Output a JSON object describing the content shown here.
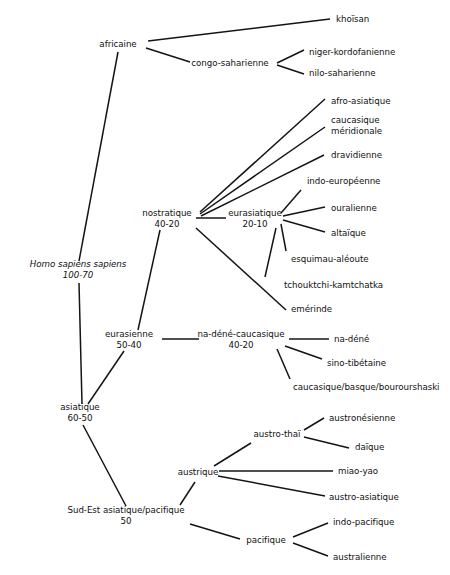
{
  "diagram": {
    "type": "phylogenetic-tree",
    "orientation": "left-to-right",
    "line_color": "#141414",
    "background_color": "#ffffff",
    "text_color": "#111111"
  },
  "nodes": [
    {
      "id": "hss",
      "name": "Homo sapiens sapiens",
      "date": "100-70",
      "italic": true,
      "x": 78,
      "y": 270,
      "align": "center"
    },
    {
      "id": "africaine",
      "name": "africaine",
      "date": "",
      "italic": false,
      "x": 118,
      "y": 44,
      "align": "center"
    },
    {
      "id": "khoisan",
      "name": "khoïsan",
      "date": "",
      "italic": false,
      "x": 336,
      "y": 19,
      "align": "left"
    },
    {
      "id": "congosah",
      "name": "congo-saharienne",
      "date": "",
      "italic": false,
      "x": 230,
      "y": 63,
      "align": "center"
    },
    {
      "id": "nigerkord",
      "name": "niger-kordofanienne",
      "date": "",
      "italic": false,
      "x": 309,
      "y": 52,
      "align": "left"
    },
    {
      "id": "nilosah",
      "name": "nilo-saharienne",
      "date": "",
      "italic": false,
      "x": 309,
      "y": 73,
      "align": "left"
    },
    {
      "id": "nostratique",
      "name": "nostratique",
      "date": "40-20",
      "italic": false,
      "x": 167,
      "y": 219,
      "align": "center"
    },
    {
      "id": "eurasiatique",
      "name": "eurasiatique",
      "date": "20-10",
      "italic": false,
      "x": 255,
      "y": 219,
      "align": "center"
    },
    {
      "id": "afroasia",
      "name": "afro-asiatique",
      "date": "",
      "italic": false,
      "x": 331,
      "y": 101,
      "align": "left"
    },
    {
      "id": "caucmer",
      "name": "caucasique\nméridionale",
      "date": "",
      "italic": false,
      "x": 331,
      "y": 126,
      "align": "left"
    },
    {
      "id": "dravidienne",
      "name": "dravidienne",
      "date": "",
      "italic": false,
      "x": 331,
      "y": 155,
      "align": "left"
    },
    {
      "id": "indoeuro",
      "name": "indo-européenne",
      "date": "",
      "italic": false,
      "x": 307,
      "y": 181,
      "align": "left"
    },
    {
      "id": "ouralienne",
      "name": "ouralienne",
      "date": "",
      "italic": false,
      "x": 331,
      "y": 208,
      "align": "left"
    },
    {
      "id": "altaique",
      "name": "altaïque",
      "date": "",
      "italic": false,
      "x": 331,
      "y": 233,
      "align": "left"
    },
    {
      "id": "esquimau",
      "name": "esquimau-aléoute",
      "date": "",
      "italic": false,
      "x": 291,
      "y": 259,
      "align": "left"
    },
    {
      "id": "tchouktchi",
      "name": "tchouktchi-kamtchatka",
      "date": "",
      "italic": false,
      "x": 284,
      "y": 285,
      "align": "left"
    },
    {
      "id": "emerinde",
      "name": "emérinde",
      "date": "",
      "italic": false,
      "x": 291,
      "y": 309,
      "align": "left"
    },
    {
      "id": "eurasienne",
      "name": "eurasienne",
      "date": "50-40",
      "italic": false,
      "x": 129,
      "y": 340,
      "align": "center"
    },
    {
      "id": "nadenecauc",
      "name": "na-déné-caucasique",
      "date": "40-20",
      "italic": false,
      "x": 241,
      "y": 340,
      "align": "center"
    },
    {
      "id": "nadene",
      "name": "na-déné",
      "date": "",
      "italic": false,
      "x": 334,
      "y": 339,
      "align": "left"
    },
    {
      "id": "sinotib",
      "name": "sino-tibétaine",
      "date": "",
      "italic": false,
      "x": 327,
      "y": 363,
      "align": "left"
    },
    {
      "id": "caucbasque",
      "name": "caucasique/basque/bourourshaski",
      "date": "",
      "italic": false,
      "x": 293,
      "y": 387,
      "align": "left"
    },
    {
      "id": "asiatique",
      "name": "asiatique",
      "date": "60-50",
      "italic": false,
      "x": 80,
      "y": 413,
      "align": "center"
    },
    {
      "id": "sudest",
      "name": "Sud-Est asiatique/pacifique",
      "date": "50",
      "italic": false,
      "x": 126,
      "y": 516,
      "align": "center"
    },
    {
      "id": "austrothai",
      "name": "austro-thaï",
      "date": "",
      "italic": false,
      "x": 277,
      "y": 434,
      "align": "center"
    },
    {
      "id": "austrique",
      "name": "austrique",
      "date": "",
      "italic": false,
      "x": 198,
      "y": 472,
      "align": "center"
    },
    {
      "id": "austronesien",
      "name": "austronésienne",
      "date": "",
      "italic": false,
      "x": 329,
      "y": 418,
      "align": "left"
    },
    {
      "id": "daique",
      "name": "daïque",
      "date": "",
      "italic": false,
      "x": 355,
      "y": 447,
      "align": "left"
    },
    {
      "id": "miaoyao",
      "name": "miao-yao",
      "date": "",
      "italic": false,
      "x": 338,
      "y": 471,
      "align": "left"
    },
    {
      "id": "austroasia",
      "name": "austro-asiatique",
      "date": "",
      "italic": false,
      "x": 329,
      "y": 497,
      "align": "left"
    },
    {
      "id": "pacifique",
      "name": "pacifique",
      "date": "",
      "italic": false,
      "x": 266,
      "y": 540,
      "align": "center"
    },
    {
      "id": "indopac",
      "name": "indo-pacifique",
      "date": "",
      "italic": false,
      "x": 333,
      "y": 522,
      "align": "left"
    },
    {
      "id": "australienne",
      "name": "australienne",
      "date": "",
      "italic": false,
      "x": 333,
      "y": 557,
      "align": "left"
    }
  ],
  "edges": [
    {
      "from": "africaine",
      "to": "khoisan",
      "x1": 148,
      "y1": 41,
      "x2": 330,
      "y2": 19
    },
    {
      "from": "africaine",
      "to": "congosah",
      "x1": 146,
      "y1": 48,
      "x2": 190,
      "y2": 62
    },
    {
      "from": "congosah",
      "to": "nigerkord",
      "x1": 277,
      "y1": 63,
      "x2": 304,
      "y2": 50
    },
    {
      "from": "congosah",
      "to": "nilosah",
      "x1": 277,
      "y1": 65,
      "x2": 304,
      "y2": 74
    },
    {
      "from": "africaine",
      "to": "hss",
      "x1": 118,
      "y1": 52,
      "x2": 79,
      "y2": 261
    },
    {
      "from": "nostratique",
      "to": "afroasia",
      "x1": 200,
      "y1": 212,
      "x2": 325,
      "y2": 99
    },
    {
      "from": "nostratique",
      "to": "caucmer",
      "x1": 200,
      "y1": 214,
      "x2": 325,
      "y2": 127
    },
    {
      "from": "nostratique",
      "to": "dravidienne",
      "x1": 201,
      "y1": 216,
      "x2": 324,
      "y2": 155
    },
    {
      "from": "eurasiatique",
      "to": "indoeuro",
      "x1": 281,
      "y1": 213,
      "x2": 301,
      "y2": 190
    },
    {
      "from": "eurasiatique",
      "to": "ouralienne",
      "x1": 283,
      "y1": 216,
      "x2": 325,
      "y2": 207
    },
    {
      "from": "eurasiatique",
      "to": "altaique",
      "x1": 283,
      "y1": 220,
      "x2": 325,
      "y2": 232
    },
    {
      "from": "eurasiatique",
      "to": "esquimau",
      "x1": 281,
      "y1": 224,
      "x2": 286,
      "y2": 251
    },
    {
      "from": "eurasiatique",
      "to": "tchouktchi",
      "x1": 276,
      "y1": 228,
      "x2": 265,
      "y2": 277
    },
    {
      "from": "nostratique",
      "to": "eurasiatique",
      "x1": 196,
      "y1": 218,
      "x2": 226,
      "y2": 218
    },
    {
      "from": "nostratique",
      "to": "emerinde",
      "x1": 196,
      "y1": 228,
      "x2": 286,
      "y2": 310
    },
    {
      "from": "nostratique",
      "to": "eurasienne",
      "x1": 160,
      "y1": 230,
      "x2": 138,
      "y2": 330
    },
    {
      "from": "eurasienne",
      "to": "nadenecauc",
      "x1": 162,
      "y1": 339,
      "x2": 199,
      "y2": 339
    },
    {
      "from": "nadenecauc",
      "to": "nadene",
      "x1": 289,
      "y1": 339,
      "x2": 329,
      "y2": 339
    },
    {
      "from": "nadenecauc",
      "to": "sinotib",
      "x1": 285,
      "y1": 346,
      "x2": 322,
      "y2": 359
    },
    {
      "from": "nadenecauc",
      "to": "caucbasque",
      "x1": 277,
      "y1": 349,
      "x2": 290,
      "y2": 379
    },
    {
      "from": "hss",
      "to": "asiatique",
      "x1": 79,
      "y1": 283,
      "x2": 82,
      "y2": 404
    },
    {
      "from": "eurasienne",
      "to": "asiatique",
      "x1": 124,
      "y1": 351,
      "x2": 88,
      "y2": 404
    },
    {
      "from": "asiatique",
      "to": "sudest",
      "x1": 83,
      "y1": 425,
      "x2": 126,
      "y2": 506
    },
    {
      "from": "sudest",
      "to": "austrique",
      "x1": 180,
      "y1": 505,
      "x2": 195,
      "y2": 482
    },
    {
      "from": "austrique",
      "to": "austrothai",
      "x1": 214,
      "y1": 466,
      "x2": 251,
      "y2": 443
    },
    {
      "from": "austrothai",
      "to": "austronesien",
      "x1": 304,
      "y1": 430,
      "x2": 324,
      "y2": 418
    },
    {
      "from": "austrothai",
      "to": "daique",
      "x1": 304,
      "y1": 437,
      "x2": 349,
      "y2": 448
    },
    {
      "from": "austrique",
      "to": "miaoyao",
      "x1": 219,
      "y1": 471,
      "x2": 333,
      "y2": 471
    },
    {
      "from": "austrique",
      "to": "austroasia",
      "x1": 218,
      "y1": 476,
      "x2": 325,
      "y2": 496
    },
    {
      "from": "sudest",
      "to": "pacifique",
      "x1": 190,
      "y1": 524,
      "x2": 240,
      "y2": 539
    },
    {
      "from": "pacifique",
      "to": "indopac",
      "x1": 293,
      "y1": 537,
      "x2": 328,
      "y2": 523
    },
    {
      "from": "pacifique",
      "to": "australienne",
      "x1": 293,
      "y1": 543,
      "x2": 328,
      "y2": 556
    }
  ]
}
